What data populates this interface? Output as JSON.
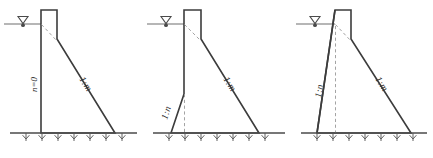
{
  "sheet": {
    "title": "Dam cross-section slope notation figures",
    "background_color": "#ffffff",
    "line_color": "#3c3c3c",
    "dashed_color": "#9a9a9a",
    "ground_color": "#4a4a4a",
    "width": 433,
    "height": 158
  },
  "figures": [
    {
      "id": "figure-1",
      "name": "vertical-upstream-face-dam",
      "upstream_label": "n=0",
      "downstream_label": "1:m",
      "water_symbol": "water-level-triangle"
    },
    {
      "id": "figure-2",
      "name": "partial-batter-upstream-face-dam",
      "upstream_label": "1:n",
      "downstream_label": "1:m",
      "water_symbol": "water-level-triangle"
    },
    {
      "id": "figure-3",
      "name": "full-slope-upstream-face-dam",
      "upstream_label": "1:n",
      "downstream_label": "1:m",
      "water_symbol": "water-level-triangle"
    }
  ]
}
